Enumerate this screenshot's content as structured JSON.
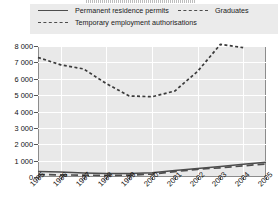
{
  "chart_data": {
    "type": "line",
    "title": "",
    "xlabel": "",
    "ylabel": "",
    "x": [
      1995,
      1996,
      1997,
      1998,
      1999,
      2000,
      2001,
      2002,
      2003,
      2004,
      2005
    ],
    "xlim": [
      1995,
      2005
    ],
    "ylim": [
      0,
      8000
    ],
    "yticks": [
      0,
      1000,
      2000,
      3000,
      4000,
      5000,
      6000,
      7000,
      8000
    ],
    "ytick_labels": [
      "0",
      "1 000",
      "2 000",
      "3 000",
      "4 000",
      "5 000",
      "6 000",
      "7 000",
      "8 000"
    ],
    "xtick_labels": [
      "1995",
      "1996",
      "1997",
      "1998",
      "1999",
      "2000",
      "2001",
      "2002",
      "2003",
      "2004",
      "2005"
    ],
    "grid": true,
    "legend_position": "top",
    "series": [
      {
        "name": "Permanent residence permits",
        "style": "solid",
        "color": "#4d4d4d",
        "values": [
          330,
          300,
          250,
          215,
          210,
          260,
          400,
          520,
          640,
          780,
          900
        ]
      },
      {
        "name": "Graduates",
        "style": "dotted",
        "color": "#3a3a3a",
        "values": [
          7300,
          6850,
          6600,
          5700,
          4950,
          4900,
          5250,
          6450,
          8100,
          7900,
          null
        ]
      },
      {
        "name": "Temporary employment authorisations",
        "style": "dashed",
        "color": "#4d4d4d",
        "values": [
          150,
          130,
          110,
          100,
          110,
          180,
          330,
          470,
          560,
          680,
          800
        ]
      }
    ]
  },
  "legend": {
    "items": [
      {
        "label": "Permanent residence permits",
        "style": "solid"
      },
      {
        "label": "Graduates",
        "style": "dotted"
      },
      {
        "label": "Temporary employment authorisations",
        "style": "dashed"
      }
    ]
  }
}
